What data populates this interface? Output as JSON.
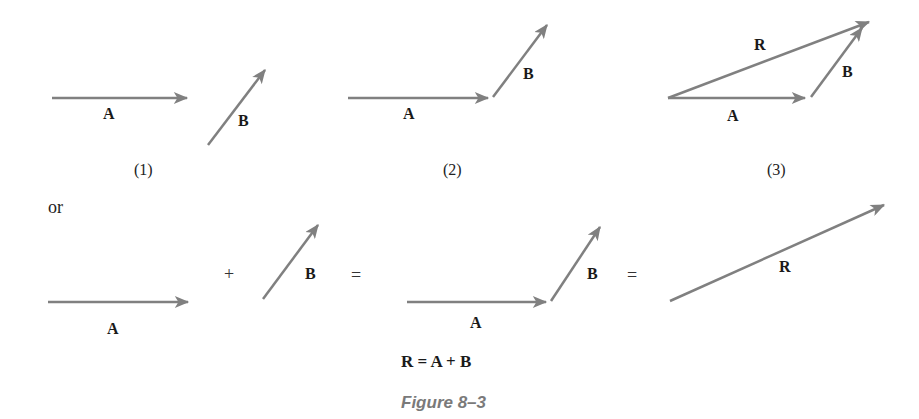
{
  "figure": {
    "caption": "Figure 8–3",
    "arrow_color": "#808080",
    "panels": [
      {
        "id": "1",
        "label": "(1)",
        "vectors": [
          "A",
          "B"
        ]
      },
      {
        "id": "2",
        "label": "(2)",
        "vectors": [
          "A",
          "B"
        ]
      },
      {
        "id": "3",
        "label": "(3)",
        "vectors": [
          "A",
          "B",
          "R"
        ]
      }
    ],
    "connector": "or",
    "equation_row": {
      "plus": "+",
      "equals1": "=",
      "equals2": "="
    },
    "equation": "R = A + B"
  },
  "labels": {
    "A": "A",
    "B": "B",
    "R": "R"
  }
}
